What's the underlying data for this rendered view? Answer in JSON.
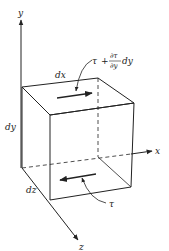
{
  "diagram": {
    "axes": {
      "x": "x",
      "y": "y",
      "z": "z"
    },
    "dimensions": {
      "dx": "dx",
      "dy": "dy",
      "dz": "dz"
    },
    "stress_top": {
      "tau": "τ",
      "plus": "+",
      "num": "∂τ",
      "den": "∂y",
      "tail": "dy"
    },
    "stress_bottom": "τ",
    "colors": {
      "line": "#222222",
      "background": "#ffffff"
    }
  }
}
